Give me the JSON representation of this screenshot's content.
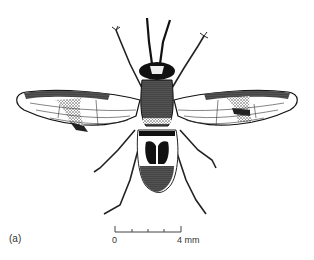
{
  "figure": {
    "panel_label": "(a)",
    "scale_bar": {
      "start_label": "0",
      "end_label": "4 mm",
      "ticks": 5,
      "length_mm": 4
    },
    "colors": {
      "ink": "#111111",
      "stipple": "#555555",
      "background": "#ffffff"
    }
  }
}
